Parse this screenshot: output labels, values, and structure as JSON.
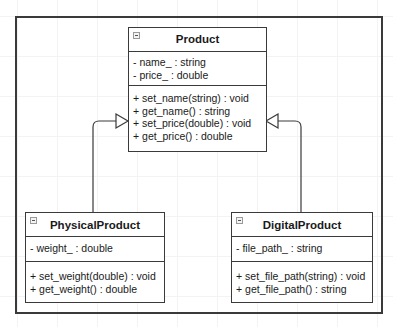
{
  "diagram": {
    "type": "UML class diagram",
    "relationship": "generalization (inheritance)",
    "classes": [
      {
        "id": "product",
        "name": "Product",
        "attributes": [
          "- name_ : string",
          "- price_ : double"
        ],
        "methods": [
          "+ set_name(string) : void",
          "+ get_name() : string",
          "+ set_price(double) : void",
          "+ get_price() : double"
        ]
      },
      {
        "id": "physical_product",
        "name": "PhysicalProduct",
        "attributes": [
          "- weight_ : double"
        ],
        "methods": [
          "+ set_weight(double) : void",
          "+ get_weight() : double"
        ]
      },
      {
        "id": "digital_product",
        "name": "DigitalProduct",
        "attributes": [
          "- file_path_ : string"
        ],
        "methods": [
          "+ set_file_path(string) : void",
          "+ get_file_path() : string"
        ]
      }
    ],
    "edges": [
      {
        "from": "PhysicalProduct",
        "to": "Product",
        "kind": "inheritance",
        "arrowhead": "hollow-triangle"
      },
      {
        "from": "DigitalProduct",
        "to": "Product",
        "kind": "inheritance",
        "arrowhead": "hollow-triangle"
      }
    ],
    "icons": {
      "collapse": "collapse-minus-icon"
    },
    "colors": {
      "line": "#3a3a3a",
      "background": "#ffffff",
      "grid": "#f3f3f3"
    }
  }
}
